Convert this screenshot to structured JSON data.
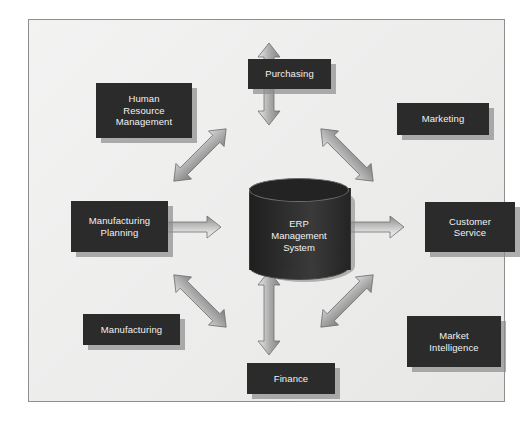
{
  "diagram": {
    "title": "ERP Management System",
    "type": "hub-and-spoke",
    "center": {
      "id": "erp-core",
      "label": "ERP\nManagement\nSystem",
      "shape": "cylinder",
      "fill_color": "#2b2b2b",
      "text_color": "#f2f2f2"
    },
    "modules": [
      {
        "id": "purchasing",
        "label": "Purchasing",
        "position": "top"
      },
      {
        "id": "human-resource",
        "label": "Human\nResource\nManagement",
        "position": "top-left"
      },
      {
        "id": "marketing",
        "label": "Marketing",
        "position": "top-right"
      },
      {
        "id": "mfg-planning",
        "label": "Manufacturing\nPlanning",
        "position": "left"
      },
      {
        "id": "customer-service",
        "label": "Customer\nService",
        "position": "right"
      },
      {
        "id": "manufacturing",
        "label": "Manufacturing",
        "position": "bottom-left"
      },
      {
        "id": "market-intel",
        "label": "Market\nIntelligence",
        "position": "bottom-right"
      },
      {
        "id": "finance",
        "label": "Finance",
        "position": "bottom"
      }
    ],
    "connectors": [
      {
        "from": "erp-core",
        "to": "purchasing",
        "style": "double-headed-arrow",
        "orientation": "vertical"
      },
      {
        "from": "erp-core",
        "to": "human-resource",
        "style": "double-headed-arrow",
        "orientation": "diagonal-nw"
      },
      {
        "from": "erp-core",
        "to": "marketing",
        "style": "double-headed-arrow",
        "orientation": "diagonal-ne"
      },
      {
        "from": "erp-core",
        "to": "mfg-planning",
        "style": "double-headed-arrow",
        "orientation": "horizontal"
      },
      {
        "from": "erp-core",
        "to": "customer-service",
        "style": "double-headed-arrow",
        "orientation": "horizontal"
      },
      {
        "from": "erp-core",
        "to": "manufacturing",
        "style": "double-headed-arrow",
        "orientation": "diagonal-sw"
      },
      {
        "from": "erp-core",
        "to": "market-intel",
        "style": "double-headed-arrow",
        "orientation": "diagonal-se"
      },
      {
        "from": "erp-core",
        "to": "finance",
        "style": "double-headed-arrow",
        "orientation": "vertical"
      }
    ],
    "colors": {
      "canvas_background": "#ececeb",
      "frame_border": "#8d8f8e",
      "box_fill": "#2b2b2b",
      "box_text": "#f2f2f2",
      "box_shadow": "#8c8c8c",
      "arrow_light": "#e6e6e6",
      "arrow_mid": "#b6b6b6",
      "arrow_dark": "#8a8a8a",
      "arrow_outline": "#6f6f6f",
      "page_background": "#ffffff"
    }
  }
}
